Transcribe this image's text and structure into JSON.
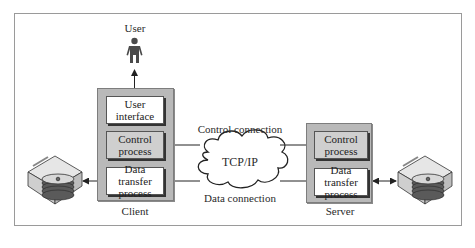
{
  "diagram": {
    "user": {
      "label": "User",
      "icon": "person-icon"
    },
    "client": {
      "label": "Client",
      "components": [
        {
          "line1": "User",
          "line2": "interface"
        },
        {
          "line1": "Control",
          "line2": "process"
        },
        {
          "line1": "Data transfer",
          "line2": "process"
        }
      ]
    },
    "server": {
      "label": "Server",
      "components": [
        {
          "line1": "Control",
          "line2": "process"
        },
        {
          "line1": "Data transfer",
          "line2": "process"
        }
      ]
    },
    "network": {
      "label": "TCP/IP",
      "icon": "cloud-icon"
    },
    "connections": {
      "control": "Control connection",
      "data": "Data connection"
    },
    "storage": {
      "icon": "disk-drive-icon"
    },
    "colors": {
      "host_fill": "#b9b9b9",
      "process_gray": "#cfcfcf",
      "process_white": "#ffffff",
      "line": "#333333"
    }
  }
}
